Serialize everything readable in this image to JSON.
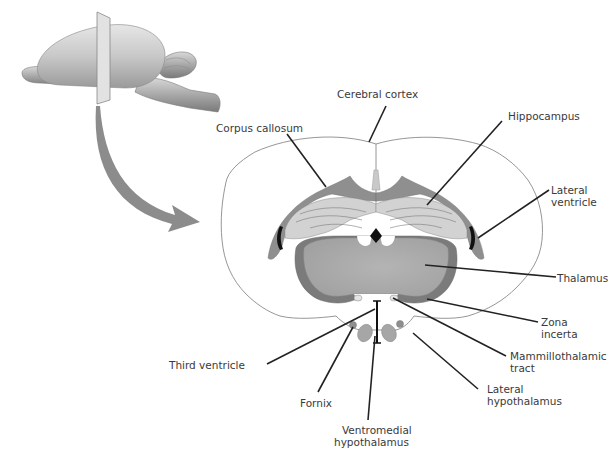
{
  "figure": {
    "type": "coronal brain section diagram",
    "inset": {
      "description": "Lateral view of whole rodent brain with a coronal cutting plane",
      "arrow": "curved arrow from cutting plane to section"
    },
    "colors": {
      "background": "#ffffff",
      "outline": "#8a8a8a",
      "dark_gray": "#7b7b7b",
      "mid_gray": "#a6a6a6",
      "light_gray": "#c9c9c9",
      "lighter_gray": "#d6d6d6",
      "ventricle_black": "#111111",
      "leader_line": "#222222",
      "label_text": "#3a3a3a",
      "arrow": "#8c8c8c"
    },
    "labels": {
      "cerebral_cortex": "Cerebral cortex",
      "corpus_callosum": "Corpus callosum",
      "hippocampus": "Hippocampus",
      "lateral_ventricle_1": "Lateral",
      "lateral_ventricle_2": "ventricle",
      "thalamus": "Thalamus",
      "zona_incerta_1": "Zona",
      "zona_incerta_2": "incerta",
      "mammillothalamic_1": "Mammillothalamic",
      "mammillothalamic_2": "tract",
      "lateral_hypothalamus_1": "Lateral",
      "lateral_hypothalamus_2": "hypothalamus",
      "ventromedial_1": "Ventromedial",
      "ventromedial_2": "hypothalamus",
      "fornix": "Fornix",
      "third_ventricle": "Third ventricle"
    }
  }
}
